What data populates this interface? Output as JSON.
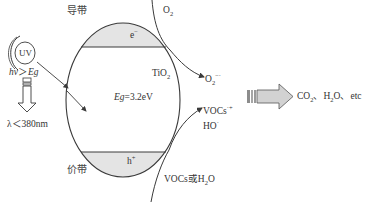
{
  "diagram": {
    "title_hidden": "TiO2 photocatalysis mechanism",
    "light_source": {
      "label": "UV",
      "condition": "hν＞Eg",
      "condition_h": "hν",
      "condition_rel": "＞",
      "condition_eg": "Eg",
      "wavelength": "λ＜380nm"
    },
    "semiconductor": {
      "material_main": "TiO",
      "material_sub": "2",
      "band_gap_var": "Eg",
      "band_gap_value": "=3.2eV",
      "conduction_band_label": "导带",
      "valence_band_label": "价带",
      "electron_label": "e",
      "electron_sup": "−",
      "hole_label": "h",
      "hole_sup": "+"
    },
    "reduction": {
      "reactant_main": "O",
      "reactant_sub": "2",
      "product_main": "O",
      "product_sub": "2",
      "product_sup": "−·"
    },
    "oxidation": {
      "reactant": "VOCs或H",
      "reactant_sub": "2",
      "reactant_tail": "O",
      "product1": "VOCs",
      "product1_sup": "·+",
      "product2": "HO",
      "product2_sup": "·"
    },
    "result": {
      "co2_main": "CO",
      "co2_sub": "2",
      "sep1": "、H",
      "h2o_sub": "2",
      "h2o_tail": "O、etc"
    },
    "colors": {
      "stroke": "#3a3a3a",
      "band_fill": "#e4e4e4",
      "arrow_fill": "#cfcfcf",
      "arrow_stripe": "#8c8c8c",
      "text": "#333333"
    }
  }
}
